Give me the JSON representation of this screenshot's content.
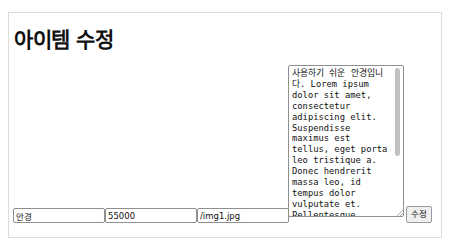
{
  "page": {
    "title": "아이템 수정"
  },
  "form": {
    "name_value": "안경",
    "price_value": "55000",
    "image_value": "/img1.jpg",
    "description_value": "사용하기 쉬운 안경입니다. Lorem ipsum dolor sit amet, consectetur adipiscing elit. Suspendisse maximus est tellus, eget porta leo tristique a. Donec hendrerit massa leo, id tempus dolor vulputate et. Pellentesque consectetur dolor placerat euismod pellentesque.",
    "submit_label": "수정"
  }
}
